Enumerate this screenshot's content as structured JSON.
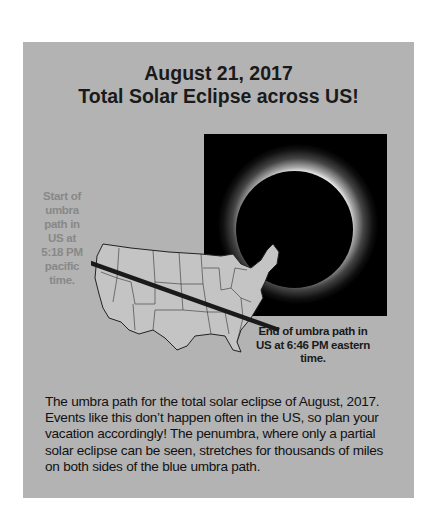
{
  "title": {
    "line1": "August 21, 2017",
    "line2": "Total Solar Eclipse across US!"
  },
  "figure": {
    "photo": "total-solar-eclipse-corona",
    "map": "contiguous-us-states-outline",
    "umbra_path": {
      "start": [
        95,
        258
      ],
      "end": [
        256,
        322
      ],
      "color": "#1a1a1a"
    },
    "start_label": "Start of umbra path in US at 5:18 PM pacific time.",
    "end_label": "End of umbra path in US at 6:46 PM eastern time."
  },
  "caption": "The umbra path for the total solar eclipse of August, 2017. Events like this don’t happen often in the US, so plan your vacation accordingly! The penumbra, where only a partial solar eclipse can be seen, stretches for thousands of miles on both sides of the blue umbra path.",
  "colors": {
    "panel": "#b3b3b3",
    "title_text": "#1a1a1a",
    "start_label_text": "#888888"
  }
}
